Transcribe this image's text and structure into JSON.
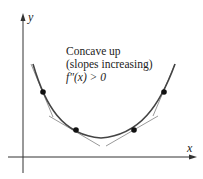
{
  "diagram": {
    "title": "Concave up",
    "annotation_lines": [
      "Concave up",
      "(slopes increasing)",
      "f″(x) > 0"
    ],
    "axes": {
      "x_label": "x",
      "y_label": "y"
    },
    "curve": "concave-up parabola-like curve",
    "points": [
      {
        "x": 43,
        "y": 92
      },
      {
        "x": 76,
        "y": 130
      },
      {
        "x": 134,
        "y": 130
      },
      {
        "x": 164,
        "y": 92
      }
    ],
    "tangent_lines": 4,
    "colors": {
      "curve": "#444444",
      "tangent": "#9a9a9a",
      "axis": "#333333",
      "point": "#111111"
    }
  }
}
